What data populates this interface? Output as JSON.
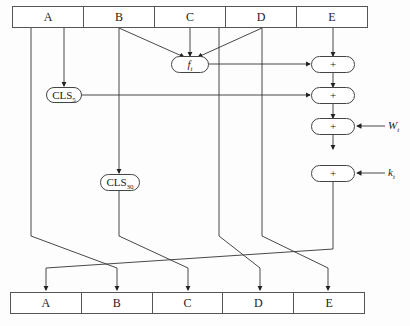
{
  "top_register": {
    "cells": [
      "A",
      "B",
      "C",
      "D",
      "E"
    ]
  },
  "bottom_register": {
    "cells": [
      "A",
      "B",
      "C",
      "D",
      "E"
    ]
  },
  "ops": {
    "f": {
      "name": "f",
      "sub": "t"
    },
    "cls5": {
      "name": "CLS",
      "sub": "5"
    },
    "cls30": {
      "name": "CLS",
      "sub": "30"
    },
    "add1": "+",
    "add2": "+",
    "add3": "+",
    "add4": "+"
  },
  "inputs": {
    "w": {
      "name": "W",
      "sub": "t"
    },
    "k": {
      "name": "k",
      "sub": "t"
    }
  }
}
